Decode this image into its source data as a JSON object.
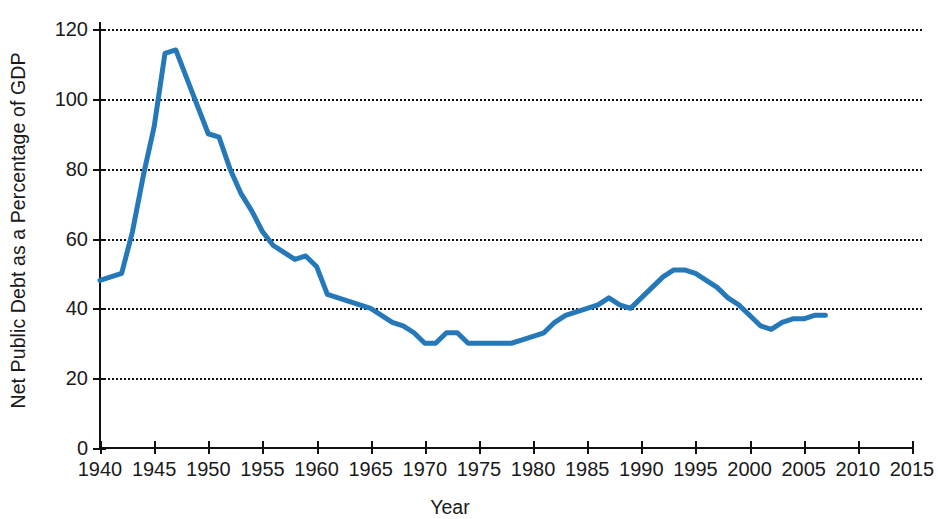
{
  "chart_data": {
    "type": "line",
    "title": "",
    "xlabel": "Year",
    "ylabel": "Net Public Debt as a Percentage of GDP",
    "xlim": [
      1940,
      2015
    ],
    "ylim": [
      0,
      120
    ],
    "xticks": [
      1940,
      1945,
      1950,
      1955,
      1960,
      1965,
      1970,
      1975,
      1980,
      1985,
      1990,
      1995,
      2000,
      2005,
      2010,
      2015
    ],
    "yticks": [
      0,
      20,
      40,
      60,
      80,
      100,
      120
    ],
    "grid": "horizontal-dotted",
    "legend": "none",
    "line_color": "#2579B8",
    "line_width": 5,
    "series": [
      {
        "name": "Net Public Debt as a Percentage of GDP",
        "x": [
          1940,
          1941,
          1942,
          1943,
          1944,
          1945,
          1946,
          1947,
          1948,
          1949,
          1950,
          1951,
          1952,
          1953,
          1954,
          1955,
          1956,
          1957,
          1958,
          1959,
          1960,
          1961,
          1962,
          1963,
          1964,
          1965,
          1966,
          1967,
          1968,
          1969,
          1970,
          1971,
          1972,
          1973,
          1974,
          1975,
          1976,
          1977,
          1978,
          1979,
          1980,
          1981,
          1982,
          1983,
          1984,
          1985,
          1986,
          1987,
          1988,
          1989,
          1990,
          1991,
          1992,
          1993,
          1994,
          1995,
          1996,
          1997,
          1998,
          1999,
          2000,
          2001,
          2002,
          2003,
          2004,
          2005,
          2006,
          2007
        ],
        "y": [
          48,
          49,
          50,
          62,
          78,
          92,
          113,
          114,
          106,
          98,
          90,
          89,
          80,
          73,
          68,
          62,
          58,
          56,
          54,
          55,
          52,
          44,
          43,
          42,
          41,
          40,
          38,
          36,
          35,
          33,
          30,
          30,
          33,
          33,
          30,
          30,
          30,
          30,
          30,
          31,
          32,
          33,
          36,
          38,
          39,
          40,
          41,
          43,
          41,
          40,
          43,
          46,
          49,
          51,
          51,
          50,
          48,
          46,
          43,
          41,
          38,
          35,
          34,
          36,
          37,
          37,
          38,
          38
        ]
      }
    ]
  },
  "axis": {
    "ylabel_text": "Net Public Debt as a Percentage of GDP",
    "xlabel_text": "Year",
    "ytick_labels": [
      "0",
      "20",
      "40",
      "60",
      "80",
      "100",
      "120"
    ],
    "xtick_labels": [
      "1940",
      "1945",
      "1950",
      "1955",
      "1960",
      "1965",
      "1970",
      "1975",
      "1980",
      "1985",
      "1990",
      "1995",
      "2000",
      "2005",
      "2010",
      "2015"
    ]
  }
}
